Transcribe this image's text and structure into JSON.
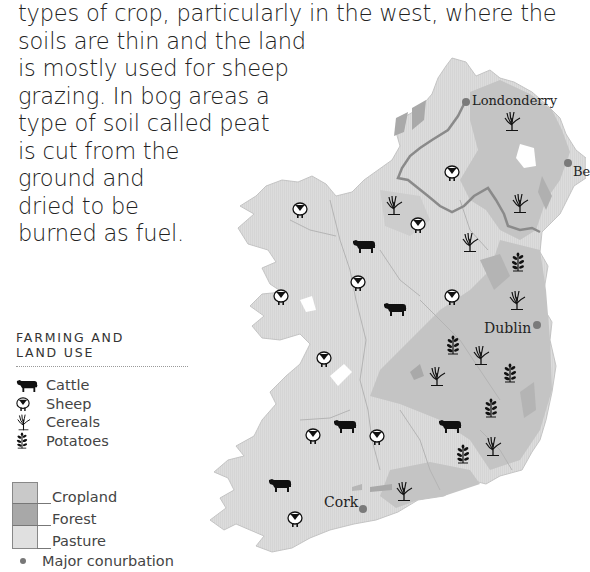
{
  "intro": {
    "lines": [
      "types of crop, particularly in the west, where the",
      "soils are thin and the land",
      "is mostly used for sheep",
      "grazing. In bog areas a",
      "type of soil called peat",
      "is cut from the",
      "ground and",
      "dried to be",
      "burned as fuel."
    ]
  },
  "legend": {
    "title_line1": "FARMING AND",
    "title_line2": "LAND USE",
    "items": [
      {
        "icon": "cattle-icon",
        "label": "Cattle"
      },
      {
        "icon": "sheep-icon",
        "label": "Sheep"
      },
      {
        "icon": "cereals-icon",
        "label": "Cereals"
      },
      {
        "icon": "potatoes-icon",
        "label": "Potatoes"
      }
    ],
    "land_use": [
      {
        "label": "Cropland",
        "color": "#c9c9c9"
      },
      {
        "label": "Forest",
        "color": "#a8a8a8"
      },
      {
        "label": "Pasture",
        "color": "#e0e0e0"
      }
    ],
    "conurbation": {
      "icon": "city-dot-icon",
      "label": "Major conurbation"
    }
  },
  "map": {
    "cities": [
      {
        "name": "Londonderry",
        "x": 466,
        "y": 101
      },
      {
        "name": "Be",
        "x": 568,
        "y": 163
      },
      {
        "name": "Dublin",
        "x": 537,
        "y": 326
      },
      {
        "name": "Cork",
        "x": 363,
        "y": 509
      }
    ],
    "colors": {
      "pasture": "#dcdcdc",
      "cropland": "#c4c4c4",
      "forest": "#a9a9a9",
      "border": "#8a8a8a",
      "river": "#b8b8b8",
      "city": "#7a7a7a"
    },
    "symbols": [
      {
        "type": "cereals",
        "x": 512,
        "y": 121
      },
      {
        "type": "sheep",
        "x": 452,
        "y": 174
      },
      {
        "type": "cereals",
        "x": 394,
        "y": 205
      },
      {
        "type": "cereals",
        "x": 520,
        "y": 203
      },
      {
        "type": "sheep",
        "x": 300,
        "y": 211
      },
      {
        "type": "sheep",
        "x": 418,
        "y": 226
      },
      {
        "type": "cereals",
        "x": 470,
        "y": 242
      },
      {
        "type": "cattle",
        "x": 364,
        "y": 246
      },
      {
        "type": "potatoes",
        "x": 518,
        "y": 262
      },
      {
        "type": "sheep",
        "x": 358,
        "y": 284
      },
      {
        "type": "sheep",
        "x": 281,
        "y": 298
      },
      {
        "type": "sheep",
        "x": 452,
        "y": 298
      },
      {
        "type": "cattle",
        "x": 395,
        "y": 309
      },
      {
        "type": "cereals",
        "x": 517,
        "y": 300
      },
      {
        "type": "potatoes",
        "x": 453,
        "y": 345
      },
      {
        "type": "cereals",
        "x": 481,
        "y": 355
      },
      {
        "type": "sheep",
        "x": 324,
        "y": 360
      },
      {
        "type": "cereals",
        "x": 437,
        "y": 376
      },
      {
        "type": "potatoes",
        "x": 510,
        "y": 373
      },
      {
        "type": "potatoes",
        "x": 491,
        "y": 408
      },
      {
        "type": "cattle",
        "x": 345,
        "y": 426
      },
      {
        "type": "cattle",
        "x": 450,
        "y": 426
      },
      {
        "type": "sheep",
        "x": 313,
        "y": 437
      },
      {
        "type": "sheep",
        "x": 377,
        "y": 438
      },
      {
        "type": "cereals",
        "x": 493,
        "y": 446
      },
      {
        "type": "potatoes",
        "x": 463,
        "y": 454
      },
      {
        "type": "cattle",
        "x": 280,
        "y": 485
      },
      {
        "type": "cereals",
        "x": 404,
        "y": 491
      },
      {
        "type": "sheep",
        "x": 295,
        "y": 520
      }
    ]
  }
}
